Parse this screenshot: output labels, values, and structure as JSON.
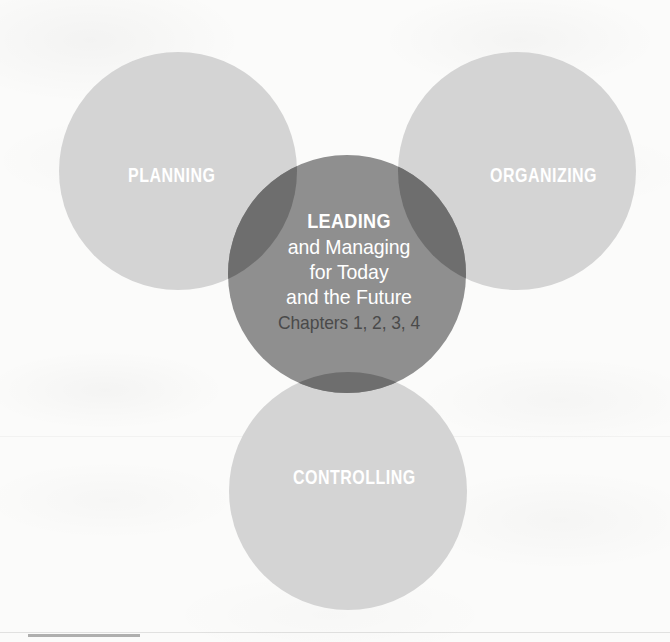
{
  "diagram": {
    "type": "venn",
    "background_color": "#fbfbfa",
    "outer_circle_color": "#d4d4d4",
    "center_circle_color": "#8f8f8f",
    "overlap_color": "#6e6e6e",
    "outer_label_color": "#ffffff",
    "center_text_color": "#ffffff",
    "chapters_text_color": "#4a4a4a",
    "circles": [
      {
        "id": "planning",
        "label": "PLANNING",
        "cx": 178,
        "cy": 171,
        "r": 119,
        "fill": "#d4d4d4"
      },
      {
        "id": "organizing",
        "label": "ORGANIZING",
        "cx": 517,
        "cy": 171,
        "r": 119,
        "fill": "#d4d4d4"
      },
      {
        "id": "controlling",
        "label": "CONTROLLING",
        "cx": 348,
        "cy": 491,
        "r": 119,
        "fill": "#d4d4d4"
      },
      {
        "id": "leading",
        "label": "LEADING",
        "cx": 347,
        "cy": 274,
        "r": 119,
        "fill": "#8f8f8f"
      }
    ],
    "center": {
      "headline": "LEADING",
      "lines": [
        "and Managing",
        "for Today",
        "and the Future"
      ],
      "chapters": "Chapters 1, 2, 3, 4"
    }
  }
}
